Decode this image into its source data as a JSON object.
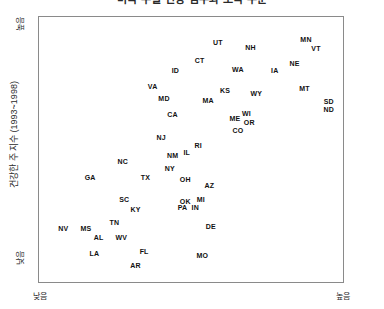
{
  "chart_data": {
    "type": "scatter",
    "title": "미국 주별 건강 점수와 소득 수준",
    "xlabel_low": "낮음",
    "xlabel_high": "높음",
    "ylabel": "건강한 주 지수 (1993~1998)",
    "ylabel_low": "낮음",
    "ylabel_high": "높음",
    "grid": false,
    "legend": "none",
    "xlim": [
      0,
      100
    ],
    "ylim": [
      0,
      100
    ],
    "point_label_format": "state-abbreviation",
    "points": [
      {
        "label": "UT",
        "x": 59.5,
        "y": 93.5
      },
      {
        "label": "NH",
        "x": 71.0,
        "y": 91.5
      },
      {
        "label": "MN",
        "x": 90.5,
        "y": 94.5
      },
      {
        "label": "VT",
        "x": 94.0,
        "y": 91.0
      },
      {
        "label": "CT",
        "x": 53.0,
        "y": 86.0
      },
      {
        "label": "NE",
        "x": 86.5,
        "y": 85.0
      },
      {
        "label": "ID",
        "x": 44.5,
        "y": 82.0
      },
      {
        "label": "WA",
        "x": 66.5,
        "y": 82.5
      },
      {
        "label": "IA",
        "x": 79.5,
        "y": 82.0
      },
      {
        "label": "VA",
        "x": 36.5,
        "y": 75.5
      },
      {
        "label": "KS",
        "x": 62.0,
        "y": 74.0
      },
      {
        "label": "WY",
        "x": 73.0,
        "y": 72.5
      },
      {
        "label": "MT",
        "x": 90.0,
        "y": 74.5
      },
      {
        "label": "MD",
        "x": 40.5,
        "y": 70.5
      },
      {
        "label": "MA",
        "x": 56.0,
        "y": 70.0
      },
      {
        "label": "SD",
        "x": 98.5,
        "y": 69.5
      },
      {
        "label": "ND",
        "x": 98.5,
        "y": 66.0
      },
      {
        "label": "CA",
        "x": 43.5,
        "y": 64.0
      },
      {
        "label": "WI",
        "x": 69.5,
        "y": 64.5
      },
      {
        "label": "ME",
        "x": 65.5,
        "y": 62.5
      },
      {
        "label": "OR",
        "x": 70.5,
        "y": 61.0
      },
      {
        "label": "CO",
        "x": 66.5,
        "y": 57.5
      },
      {
        "label": "NJ",
        "x": 39.5,
        "y": 54.5
      },
      {
        "label": "RI",
        "x": 52.5,
        "y": 51.5
      },
      {
        "label": "NM",
        "x": 43.5,
        "y": 47.5
      },
      {
        "label": "IL",
        "x": 48.5,
        "y": 48.5
      },
      {
        "label": "NC",
        "x": 26.0,
        "y": 45.0
      },
      {
        "label": "NY",
        "x": 42.5,
        "y": 42.0
      },
      {
        "label": "GA",
        "x": 14.5,
        "y": 38.5
      },
      {
        "label": "TX",
        "x": 34.0,
        "y": 38.5
      },
      {
        "label": "OH",
        "x": 48.0,
        "y": 37.5
      },
      {
        "label": "AZ",
        "x": 56.5,
        "y": 35.0
      },
      {
        "label": "OK",
        "x": 48.0,
        "y": 28.5
      },
      {
        "label": "MI",
        "x": 53.5,
        "y": 29.5
      },
      {
        "label": "SC",
        "x": 26.5,
        "y": 29.5
      },
      {
        "label": "PA",
        "x": 47.0,
        "y": 26.0
      },
      {
        "label": "IN",
        "x": 51.5,
        "y": 26.0
      },
      {
        "label": "KY",
        "x": 30.5,
        "y": 25.5
      },
      {
        "label": "TN",
        "x": 23.0,
        "y": 20.0
      },
      {
        "label": "NV",
        "x": 5.0,
        "y": 17.5
      },
      {
        "label": "MS",
        "x": 13.0,
        "y": 17.5
      },
      {
        "label": "DE",
        "x": 57.0,
        "y": 18.5
      },
      {
        "label": "AL",
        "x": 17.5,
        "y": 14.0
      },
      {
        "label": "WV",
        "x": 25.5,
        "y": 14.0
      },
      {
        "label": "FL",
        "x": 33.5,
        "y": 8.0
      },
      {
        "label": "LA",
        "x": 16.0,
        "y": 7.5
      },
      {
        "label": "MO",
        "x": 54.0,
        "y": 6.5
      },
      {
        "label": "AR",
        "x": 30.5,
        "y": 2.5
      }
    ]
  }
}
